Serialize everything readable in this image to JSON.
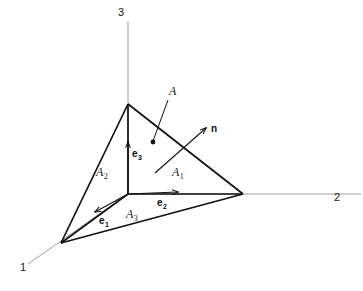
{
  "figure": {
    "name": "cauchy-tetrahedron-diagram",
    "background_color": "#ffffff",
    "ink_color": "#1a1a1a",
    "axis_color": "#808080",
    "edge_color": "#111111"
  },
  "axes": {
    "items": [
      {
        "id": "axis-1",
        "label": "1",
        "label_x": 20,
        "label_y": 271,
        "from_x": 128,
        "from_y": 194,
        "to_x": 28,
        "to_y": 264
      },
      {
        "id": "axis-2",
        "label": "2",
        "label_x": 334,
        "label_y": 201,
        "from_x": 128,
        "from_y": 194,
        "to_x": 361,
        "to_y": 194
      },
      {
        "id": "axis-3",
        "label": "3",
        "label_x": 118,
        "label_y": 16,
        "from_x": 128,
        "from_y": 194,
        "to_x": 128,
        "to_y": 21
      }
    ]
  },
  "tetrahedron": {
    "origin": {
      "x": 128,
      "y": 194
    },
    "vertex_1": {
      "x": 61,
      "y": 243
    },
    "vertex_2": {
      "x": 243,
      "y": 194
    },
    "vertex_3": {
      "x": 128,
      "y": 104
    },
    "oblique_face_path": "M 128 104 L 243 194 L 61 243 Z",
    "edges": [
      {
        "id": "edge-origin-to-v3",
        "x1": 128,
        "y1": 194,
        "x2": 128,
        "y2": 104
      },
      {
        "id": "edge-origin-to-v2",
        "x1": 128,
        "y1": 194,
        "x2": 243,
        "y2": 194
      },
      {
        "id": "edge-origin-to-v1",
        "x1": 128,
        "y1": 194,
        "x2": 61,
        "y2": 243
      },
      {
        "id": "edge-v3-to-v2",
        "x1": 128,
        "y1": 104,
        "x2": 243,
        "y2": 194
      },
      {
        "id": "edge-v3-to-v1",
        "x1": 128,
        "y1": 104,
        "x2": 61,
        "y2": 243
      },
      {
        "id": "edge-v1-to-v2",
        "x1": 61,
        "y1": 243,
        "x2": 243,
        "y2": 194
      }
    ]
  },
  "labels": {
    "oblique_face": {
      "text": "A",
      "x": 169,
      "y": 95
    },
    "face_1": {
      "text": "A",
      "sub": "1",
      "x": 172,
      "y": 176
    },
    "face_2": {
      "text": "A",
      "sub": "2",
      "x": 96,
      "y": 176
    },
    "face_3": {
      "text": "A",
      "sub": "3",
      "x": 126,
      "y": 218
    },
    "normal": {
      "text": "n",
      "x": 211,
      "y": 132
    }
  },
  "basis_vectors": [
    {
      "id": "e1",
      "text": "e",
      "sub": "1",
      "label_x": 99,
      "label_y": 224,
      "x1": 128,
      "y1": 194,
      "x2": 95,
      "y2": 212
    },
    {
      "id": "e2",
      "text": "e",
      "sub": "2",
      "label_x": 157,
      "label_y": 206,
      "x1": 128,
      "y1": 194,
      "x2": 178,
      "y2": 192
    },
    {
      "id": "e3",
      "text": "e",
      "sub": "3",
      "label_x": 132,
      "label_y": 157,
      "x1": 128,
      "y1": 194,
      "x2": 128,
      "y2": 142
    }
  ],
  "normal_vector": {
    "id": "n-vector",
    "x1": 155,
    "y1": 173,
    "x2": 206,
    "y2": 128
  },
  "leader_line": {
    "id": "oblique-face-leader",
    "x1": 168,
    "y1": 100,
    "x2": 153,
    "y2": 141,
    "dot_x": 153,
    "dot_y": 142,
    "dot_r": 2.4
  }
}
